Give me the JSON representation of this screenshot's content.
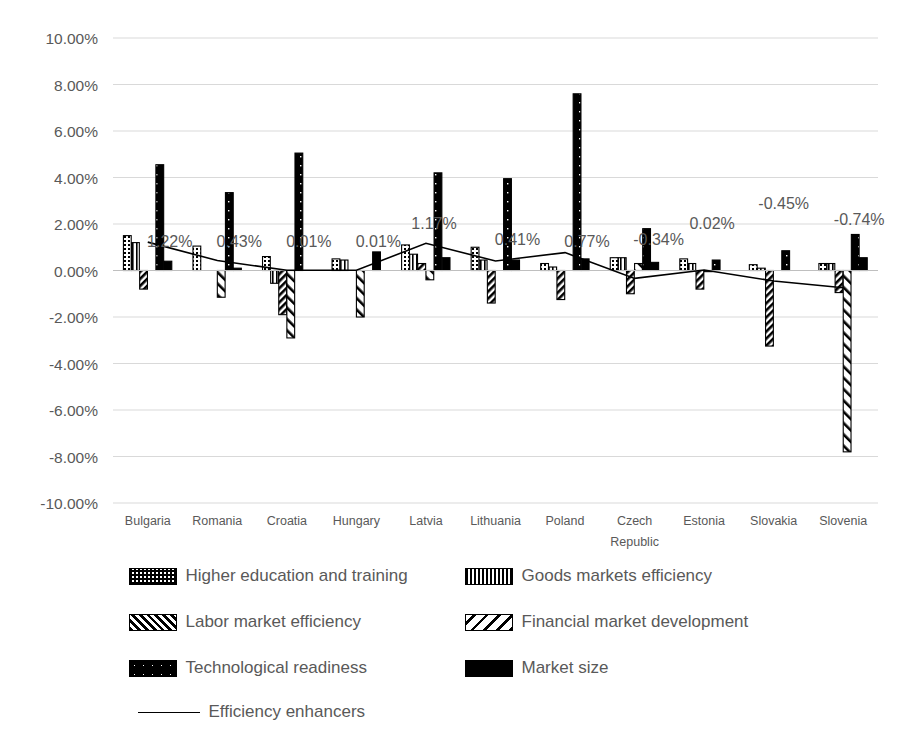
{
  "chart_data": {
    "type": "bar",
    "title": "",
    "subtitle": "",
    "xlabel": "",
    "ylabel": "",
    "ylim": [
      -10,
      10
    ],
    "ytick_step": 2,
    "grid": true,
    "legend_position": "bottom",
    "yticks": [
      "10.00%",
      "8.00%",
      "6.00%",
      "4.00%",
      "2.00%",
      "0.00%",
      "-2.00%",
      "-4.00%",
      "-6.00%",
      "-8.00%",
      "-10.00%"
    ],
    "categories": [
      "Bulgaria",
      "Romania",
      "Croatia",
      "Hungary",
      "Latvia",
      "Lithuania",
      "Poland",
      "Czech Republic",
      "Estonia",
      "Slovakia",
      "Slovenia"
    ],
    "category_lines": [
      [
        "Bulgaria"
      ],
      [
        "Romania"
      ],
      [
        "Croatia"
      ],
      [
        "Hungary"
      ],
      [
        "Latvia"
      ],
      [
        "Lithuania"
      ],
      [
        "Poland"
      ],
      [
        "Czech",
        "Republic"
      ],
      [
        "Estonia"
      ],
      [
        "Slovakia"
      ],
      [
        "Slovenia"
      ]
    ],
    "series": [
      {
        "name": "Higher education and training",
        "pattern": "dots-grid",
        "values": [
          1.5,
          1.05,
          0.6,
          0.5,
          1.1,
          1.0,
          0.3,
          0.55,
          0.5,
          0.25,
          0.3
        ]
      },
      {
        "name": "Goods markets efficiency",
        "pattern": "vertical-lines",
        "values": [
          1.2,
          0.0,
          -0.55,
          0.45,
          0.7,
          0.45,
          0.15,
          0.55,
          0.3,
          0.1,
          0.3
        ]
      },
      {
        "name": "Labor market efficiency",
        "pattern": "diagonal-dense",
        "values": [
          -0.8,
          0.0,
          -1.9,
          0.0,
          0.3,
          -1.4,
          -1.25,
          -1.0,
          -0.8,
          -3.25,
          -0.95
        ]
      },
      {
        "name": "Financial market development",
        "pattern": "diagonal-wide",
        "values": [
          0.0,
          -1.15,
          -2.9,
          -2.0,
          -0.4,
          0.0,
          0.0,
          0.3,
          -0.05,
          0.0,
          -7.8
        ]
      },
      {
        "name": "Technological readiness",
        "pattern": "black-dots",
        "values": [
          4.55,
          3.35,
          5.05,
          0.0,
          4.2,
          3.95,
          7.6,
          1.8,
          0.45,
          0.85,
          1.55
        ]
      },
      {
        "name": "Market size",
        "pattern": "solid-black",
        "values": [
          0.4,
          0.1,
          0.0,
          0.8,
          0.55,
          0.45,
          0.5,
          0.35,
          0.0,
          0.0,
          0.55
        ]
      }
    ],
    "line_series": {
      "name": "Efficiency enhancers",
      "values": [
        1.22,
        0.43,
        0.01,
        0.01,
        1.17,
        0.41,
        0.77,
        -0.34,
        0.02,
        -0.45,
        -0.74
      ]
    },
    "data_labels": [
      {
        "text": "1.22%",
        "category": "Bulgaria"
      },
      {
        "text": "0.43%",
        "category": "Romania"
      },
      {
        "text": "0.01%",
        "category": "Croatia"
      },
      {
        "text": "0.01%",
        "category": "Hungary"
      },
      {
        "text": "1.17%",
        "category": "Latvia"
      },
      {
        "text": "0.41%",
        "category": "Lithuania"
      },
      {
        "text": "0.77%",
        "category": "Poland"
      },
      {
        "text": "-0.34%",
        "category": "Czech Republic"
      },
      {
        "text": "0.02%",
        "category": "Estonia"
      },
      {
        "text": "-0.45%",
        "category": "Slovakia"
      },
      {
        "text": "-0.74%",
        "category": "Slovenia"
      }
    ],
    "colors": {
      "bar_outline": "#000000",
      "bar_fill": "#ffffff",
      "solid_bar": "#000000",
      "gridline": "#d9d9d9",
      "text": "#595959",
      "line": "#000000",
      "background": "#ffffff"
    }
  },
  "legend": {
    "items": [
      {
        "label": "Higher education and training",
        "icon": "pattern-swatch-dots-grid"
      },
      {
        "label": "Goods markets efficiency",
        "icon": "pattern-swatch-vertical-lines"
      },
      {
        "label": "Labor market efficiency",
        "icon": "pattern-swatch-diagonal-dense"
      },
      {
        "label": "Financial market development",
        "icon": "pattern-swatch-diagonal-wide"
      },
      {
        "label": "Technological readiness",
        "icon": "pattern-swatch-black-dots"
      },
      {
        "label": "Market size",
        "icon": "pattern-swatch-solid-black"
      }
    ],
    "line_item": {
      "label": "Efficiency enhancers",
      "icon": "line-swatch"
    }
  }
}
